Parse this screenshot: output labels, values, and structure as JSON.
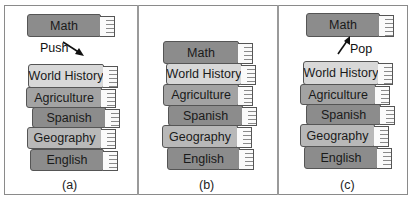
{
  "figure": {
    "panels": [
      {
        "id": "a",
        "caption": "(a)",
        "operation": "Push",
        "floating_book": "Math",
        "stack_top_to_bottom": [
          "World History",
          "Agriculture",
          "Spanish",
          "Geography",
          "English"
        ]
      },
      {
        "id": "b",
        "caption": "(b)",
        "stack_top_to_bottom": [
          "Math",
          "World History",
          "Agriculture",
          "Spanish",
          "Geography",
          "English"
        ]
      },
      {
        "id": "c",
        "caption": "(c)",
        "operation": "Pop",
        "floating_book": "Math",
        "stack_top_to_bottom": [
          "World History",
          "Agriculture",
          "Spanish",
          "Geography",
          "English"
        ]
      }
    ]
  },
  "colors": {
    "dark_cover": "#8c8c8c",
    "mid_cover": "#a3a3a3",
    "light_cover": "#d8d8d8",
    "border": "#555555"
  }
}
